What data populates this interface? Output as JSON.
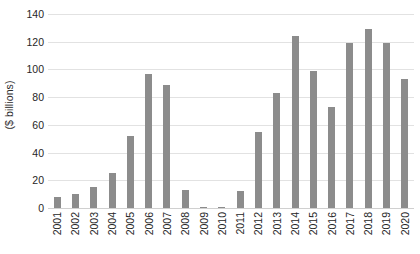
{
  "chart_data": {
    "type": "bar",
    "title": "",
    "subtitle": "",
    "xlabel": "",
    "ylabel": "($ billions)",
    "ylim": [
      0,
      140
    ],
    "ytick_step": 20,
    "yticks": [
      0,
      20,
      40,
      60,
      80,
      100,
      120,
      140
    ],
    "ytick_labels": [
      "0",
      "20",
      "40",
      "60",
      "80",
      "100",
      "120",
      "140"
    ],
    "grid": true,
    "grid_axis": "y",
    "legend": false,
    "legend_position": "none",
    "bar_color": "#8c8c8c",
    "gridline_color": "#e2e2e2",
    "categories": [
      "2001",
      "2002",
      "2003",
      "2004",
      "2005",
      "2006",
      "2007",
      "2008",
      "2009",
      "2010",
      "2011",
      "2012",
      "2013",
      "2014",
      "2015",
      "2016",
      "2017",
      "2018",
      "2019",
      "2020"
    ],
    "values": [
      8,
      10,
      15,
      25,
      52,
      97,
      89,
      13,
      1,
      1,
      12,
      55,
      83,
      124,
      99,
      73,
      119,
      129,
      119,
      93
    ],
    "series": [
      {
        "name": "",
        "values": [
          8,
          10,
          15,
          25,
          52,
          97,
          89,
          13,
          1,
          1,
          12,
          55,
          83,
          124,
          99,
          73,
          119,
          129,
          119,
          93
        ]
      }
    ],
    "annotations": []
  }
}
